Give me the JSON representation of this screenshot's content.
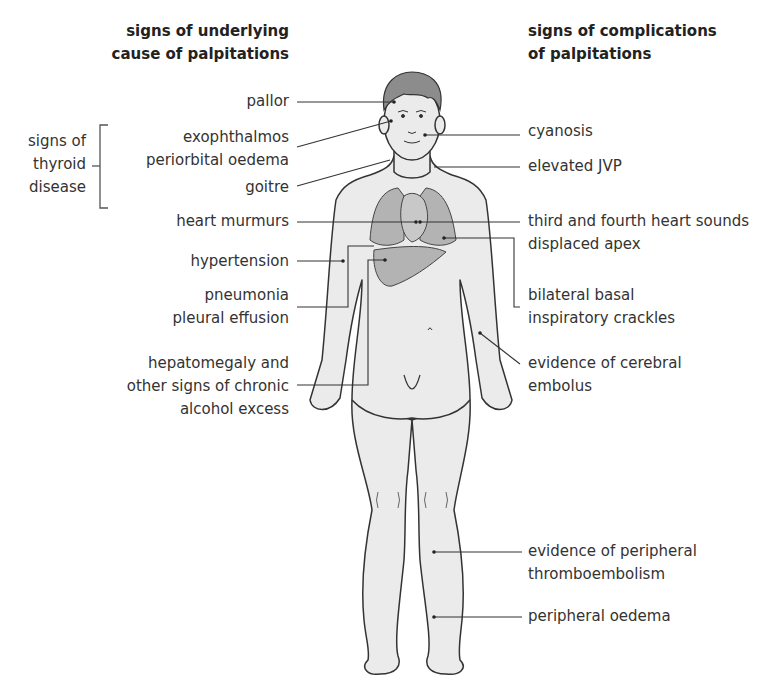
{
  "headings": {
    "left": [
      "signs of underlying",
      "cause of palpitations"
    ],
    "right": [
      "signs of complications",
      "of palpitations"
    ]
  },
  "group": {
    "label": [
      "signs of",
      "thyroid",
      "disease"
    ]
  },
  "left_labels": [
    {
      "id": "pallor",
      "lines": [
        "pallor"
      ]
    },
    {
      "id": "exophthalmos",
      "lines": [
        "exophthalmos",
        "periorbital oedema"
      ]
    },
    {
      "id": "goitre",
      "lines": [
        "goitre"
      ]
    },
    {
      "id": "heart-murmurs",
      "lines": [
        "heart murmurs"
      ]
    },
    {
      "id": "hypertension",
      "lines": [
        "hypertension"
      ]
    },
    {
      "id": "pneumonia",
      "lines": [
        "pneumonia",
        "pleural effusion"
      ]
    },
    {
      "id": "hepatomegaly",
      "lines": [
        "hepatomegaly and",
        "other signs of chronic",
        "alcohol excess"
      ]
    }
  ],
  "right_labels": [
    {
      "id": "cyanosis",
      "lines": [
        "cyanosis"
      ]
    },
    {
      "id": "elevated-jvp",
      "lines": [
        "elevated JVP"
      ]
    },
    {
      "id": "heart-sounds",
      "lines": [
        "third and fourth heart sounds",
        "displaced apex"
      ]
    },
    {
      "id": "crackles",
      "lines": [
        "bilateral  basal",
        "inspiratory crackles"
      ]
    },
    {
      "id": "cerebral-embolus",
      "lines": [
        "evidence of cerebral",
        "embolus"
      ]
    },
    {
      "id": "thromboembolism",
      "lines": [
        "evidence of peripheral",
        "thromboembolism"
      ]
    },
    {
      "id": "oedema",
      "lines": [
        "peripheral oedema"
      ]
    }
  ],
  "colors": {
    "skin": "#ebebeb",
    "hair": "#8c8c8c",
    "organ": "#b3b3b3",
    "outline": "#333333",
    "text": "#333333"
  }
}
